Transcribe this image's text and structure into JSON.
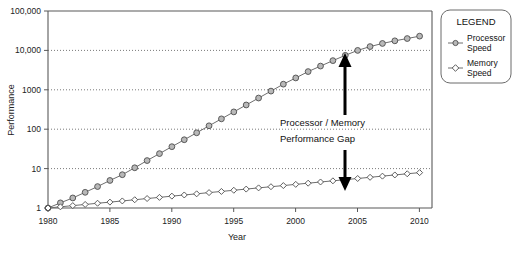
{
  "chart_data": {
    "type": "line",
    "title": "",
    "xlabel": "Year",
    "ylabel": "Performance",
    "yscale": "log",
    "ylim": [
      1,
      100000
    ],
    "xlim": [
      1980,
      2011
    ],
    "grid": true,
    "ytick_labels": [
      "1",
      "10",
      "100",
      "1000",
      "10,000",
      "100,000"
    ],
    "ytick_values": [
      1,
      10,
      100,
      1000,
      10000,
      100000
    ],
    "xtick_labels": [
      "1980",
      "1985",
      "1990",
      "1995",
      "2000",
      "2005",
      "2010"
    ],
    "xtick_values": [
      1980,
      1985,
      1990,
      1995,
      2000,
      2005,
      2010
    ],
    "legend_position": "right-outside",
    "x": [
      1980,
      1981,
      1982,
      1983,
      1984,
      1985,
      1986,
      1987,
      1988,
      1989,
      1990,
      1991,
      1992,
      1993,
      1994,
      1995,
      1996,
      1997,
      1998,
      1999,
      2000,
      2001,
      2002,
      2003,
      2004,
      2005,
      2006,
      2007,
      2008,
      2009,
      2010
    ],
    "series": [
      {
        "name": "Processor Speed",
        "marker": "circle-filled",
        "values": [
          1,
          1.35,
          1.8,
          2.5,
          3.5,
          5,
          7,
          10.5,
          16,
          24,
          36,
          54,
          81,
          122,
          183,
          275,
          412,
          618,
          927,
          1390,
          2000,
          2900,
          4000,
          5500,
          7500,
          10000,
          12500,
          15000,
          17500,
          20000,
          23000
        ]
      },
      {
        "name": "Memory Speed",
        "marker": "diamond-open",
        "values": [
          1,
          1.07,
          1.15,
          1.23,
          1.32,
          1.41,
          1.51,
          1.62,
          1.74,
          1.86,
          2.0,
          2.14,
          2.29,
          2.46,
          2.63,
          2.82,
          3.02,
          3.24,
          3.47,
          3.71,
          3.98,
          4.26,
          4.57,
          4.89,
          5.24,
          5.61,
          6.01,
          6.44,
          6.9,
          7.39,
          7.9
        ]
      }
    ],
    "annotations": [
      {
        "name": "performance-gap",
        "line1": "Processor / Memory",
        "line2": "Performance Gap",
        "arrow": "double-headed-vertical"
      }
    ]
  },
  "legend": {
    "title": "LEGEND",
    "entries": [
      {
        "label_line1": "Processor",
        "label_line2": "Speed",
        "marker": "circle-filled"
      },
      {
        "label_line1": "Memory",
        "label_line2": "Speed",
        "marker": "diamond-open"
      }
    ]
  },
  "colors": {
    "background": "#ffffff",
    "axis": "#595959",
    "grid": "#6b6b6b",
    "line": "#6e6e6e",
    "marker_processor_fill": "#b8b8b8",
    "marker_memory_fill": "#ffffff",
    "marker_stroke": "#4d4d4d",
    "text": "#1a1a1a",
    "arrow": "#000000"
  }
}
